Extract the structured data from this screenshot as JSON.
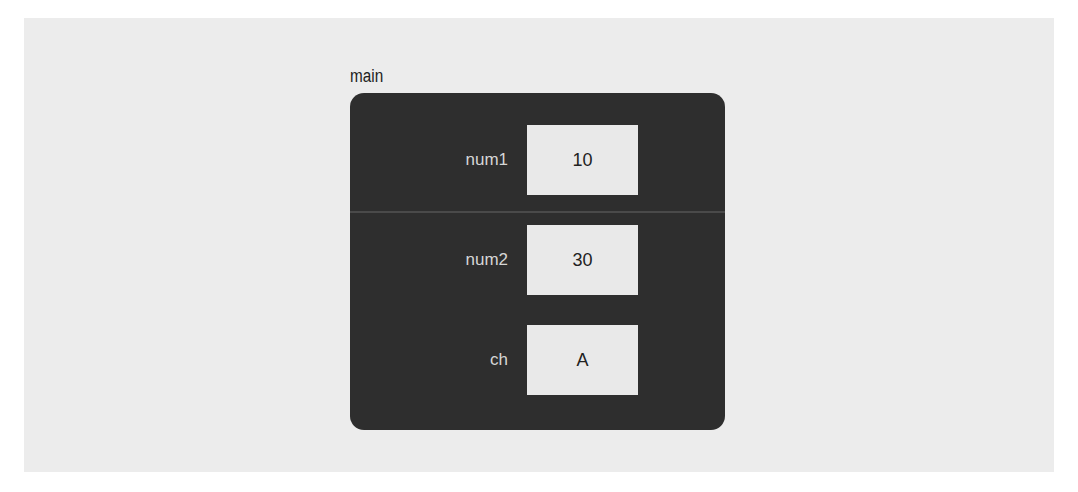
{
  "frame": {
    "name": "main",
    "variables": [
      {
        "name": "num1",
        "value": "10"
      },
      {
        "name": "num2",
        "value": "30"
      },
      {
        "name": "ch",
        "value": "A"
      }
    ]
  },
  "colors": {
    "background_panel": "#ececec",
    "frame_fill": "#2e2e2e",
    "value_box_fill": "#e9e9e9",
    "label_text": "#d6d6d6"
  }
}
